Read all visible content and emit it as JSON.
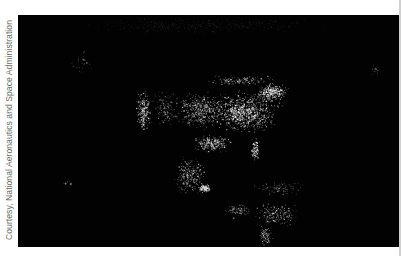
{
  "caption": {
    "credit": "Courtesy, National Aeronautics and Space Administration"
  },
  "photo": {
    "subject": "North America at night (city lights)",
    "background_color": "#020202",
    "light_color": "#ffffff",
    "clusters": [
      {
        "name": "us-east-dense",
        "cx": 245,
        "cy": 112,
        "rx": 40,
        "ry": 24,
        "n": 900,
        "bright": 0.9
      },
      {
        "name": "us-central",
        "cx": 200,
        "cy": 110,
        "rx": 32,
        "ry": 22,
        "n": 520,
        "bright": 0.7
      },
      {
        "name": "us-west-coast",
        "cx": 143,
        "cy": 112,
        "rx": 8,
        "ry": 26,
        "n": 240,
        "bright": 0.85
      },
      {
        "name": "us-mountain",
        "cx": 165,
        "cy": 108,
        "rx": 16,
        "ry": 22,
        "n": 180,
        "bright": 0.45
      },
      {
        "name": "us-northeast",
        "cx": 272,
        "cy": 92,
        "rx": 18,
        "ry": 10,
        "n": 320,
        "bright": 0.9
      },
      {
        "name": "canada-south",
        "cx": 240,
        "cy": 80,
        "rx": 40,
        "ry": 6,
        "n": 180,
        "bright": 0.6
      },
      {
        "name": "florida",
        "cx": 255,
        "cy": 150,
        "rx": 5,
        "ry": 14,
        "n": 120,
        "bright": 0.9
      },
      {
        "name": "texas-gulf",
        "cx": 212,
        "cy": 143,
        "rx": 22,
        "ry": 10,
        "n": 260,
        "bright": 0.8
      },
      {
        "name": "mexico",
        "cx": 190,
        "cy": 175,
        "rx": 18,
        "ry": 20,
        "n": 300,
        "bright": 0.7
      },
      {
        "name": "mexico-city",
        "cx": 205,
        "cy": 188,
        "rx": 8,
        "ry": 5,
        "n": 120,
        "bright": 0.95
      },
      {
        "name": "central-america",
        "cx": 238,
        "cy": 210,
        "rx": 16,
        "ry": 8,
        "n": 110,
        "bright": 0.55
      },
      {
        "name": "caribbean",
        "cx": 280,
        "cy": 188,
        "rx": 30,
        "ry": 8,
        "n": 90,
        "bright": 0.6
      },
      {
        "name": "colombia-venezuela",
        "cx": 276,
        "cy": 215,
        "rx": 26,
        "ry": 14,
        "n": 200,
        "bright": 0.7
      },
      {
        "name": "andes",
        "cx": 265,
        "cy": 235,
        "rx": 8,
        "ry": 12,
        "n": 90,
        "bright": 0.7
      },
      {
        "name": "alaska",
        "cx": 80,
        "cy": 62,
        "rx": 14,
        "ry": 12,
        "n": 35,
        "bright": 0.5
      },
      {
        "name": "hawaii",
        "cx": 69,
        "cy": 183,
        "rx": 7,
        "ry": 3,
        "n": 14,
        "bright": 0.6
      },
      {
        "name": "greenland-iceland",
        "cx": 375,
        "cy": 70,
        "rx": 6,
        "ry": 6,
        "n": 12,
        "bright": 0.5
      },
      {
        "name": "arctic-faint",
        "cx": 200,
        "cy": 25,
        "rx": 150,
        "ry": 10,
        "n": 500,
        "bright": 0.12
      }
    ],
    "rect": {
      "x": 18,
      "y": 15,
      "width": 382,
      "height": 232
    }
  }
}
